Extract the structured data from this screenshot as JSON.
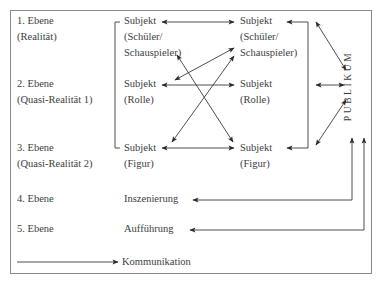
{
  "levels": [
    {
      "title": "1. Ebene",
      "subtitle": "(Realität)"
    },
    {
      "title": "2. Ebene",
      "subtitle": "(Quasi-Realität 1)"
    },
    {
      "title": "3. Ebene",
      "subtitle": "(Quasi-Realität 2)"
    },
    {
      "title": "4. Ebene"
    },
    {
      "title": "5. Ebene"
    }
  ],
  "left_column": {
    "row1": {
      "line1": "Subjekt",
      "line2": "(Schüler/",
      "line3": "Schauspieler)"
    },
    "row2": {
      "line1": "Subjekt",
      "line2": "(Rolle)"
    },
    "row3": {
      "line1": "Subjekt",
      "line2": "(Figur)"
    },
    "row4": "Inszenierung",
    "row5": "Aufführung"
  },
  "right_column": {
    "row1": {
      "line1": "Subjekt",
      "line2": "(Schüler/",
      "line3": "Schauspieler)"
    },
    "row2": {
      "line1": "Subjekt",
      "line2": "(Rolle)"
    },
    "row3": {
      "line1": "Subjekt",
      "line2": "(Figur)"
    }
  },
  "audience_label": "PUBLIKUM",
  "legend": {
    "label": "Kommunikation"
  },
  "colors": {
    "line": "#2a2a2a",
    "frame": "#8a8a8a",
    "text": "#3d3d3d"
  }
}
